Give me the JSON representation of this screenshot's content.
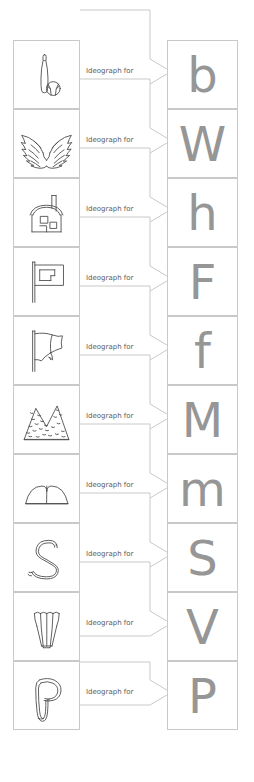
{
  "diagram": {
    "connector_label": "Ideograph for",
    "colors": {
      "page_background": "#ffffff",
      "cell_border": "#c9c9c9",
      "letter": "#969696",
      "ink": "#4a4a4a",
      "label_text": "#5c5c5c"
    },
    "rows": [
      {
        "index": 1,
        "ideograph_name": "baseball-bat-and-ball",
        "connector_label": "Ideograph for",
        "letter": "b"
      },
      {
        "index": 2,
        "ideograph_name": "wings",
        "connector_label": "Ideograph for",
        "letter": "W"
      },
      {
        "index": 3,
        "ideograph_name": "house",
        "connector_label": "Ideograph for",
        "letter": "h"
      },
      {
        "index": 4,
        "ideograph_name": "flag-straight",
        "connector_label": "Ideograph for",
        "letter": "F"
      },
      {
        "index": 5,
        "ideograph_name": "flag-waving",
        "connector_label": "Ideograph for",
        "letter": "f"
      },
      {
        "index": 6,
        "ideograph_name": "rocky-mountains",
        "connector_label": "Ideograph for",
        "letter": "M"
      },
      {
        "index": 7,
        "ideograph_name": "rolling-hills",
        "connector_label": "Ideograph for",
        "letter": "m"
      },
      {
        "index": 8,
        "ideograph_name": "snake",
        "connector_label": "Ideograph for",
        "letter": "S"
      },
      {
        "index": 9,
        "ideograph_name": "vase-tulip",
        "connector_label": "Ideograph for",
        "letter": "V"
      },
      {
        "index": 10,
        "ideograph_name": "pot-jug",
        "connector_label": "Ideograph for",
        "letter": "P"
      }
    ]
  }
}
